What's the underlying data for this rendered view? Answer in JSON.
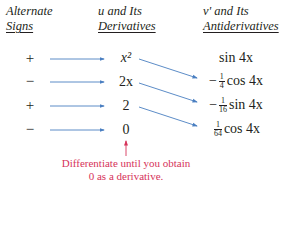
{
  "headers": {
    "signs": [
      "Alternate",
      "Signs"
    ],
    "derivatives": [
      "u and Its",
      "Derivatives"
    ],
    "antiderivatives": [
      "v' and Its",
      "Antiderivatives"
    ]
  },
  "rows": [
    {
      "sign": "+",
      "derivative": "x²",
      "antiderivative": {
        "prefix": "",
        "num": "",
        "den": "",
        "expr": "sin 4x"
      }
    },
    {
      "sign": "−",
      "derivative": "2x",
      "antiderivative": {
        "prefix": "−",
        "num": "1",
        "den": "4",
        "expr": "cos 4x"
      }
    },
    {
      "sign": "+",
      "derivative": "2",
      "antiderivative": {
        "prefix": "−",
        "num": "1",
        "den": "16",
        "expr": "sin 4x"
      }
    },
    {
      "sign": "−",
      "derivative": "0",
      "antiderivative": {
        "prefix": "",
        "num": "1",
        "den": "64",
        "expr": "cos 4x"
      }
    }
  ],
  "note": [
    "Differentiate until you obtain",
    "0 as a derivative."
  ],
  "colors": {
    "arrow": "#4a7fc1",
    "note": "#d6335a",
    "text": "#231f20"
  }
}
